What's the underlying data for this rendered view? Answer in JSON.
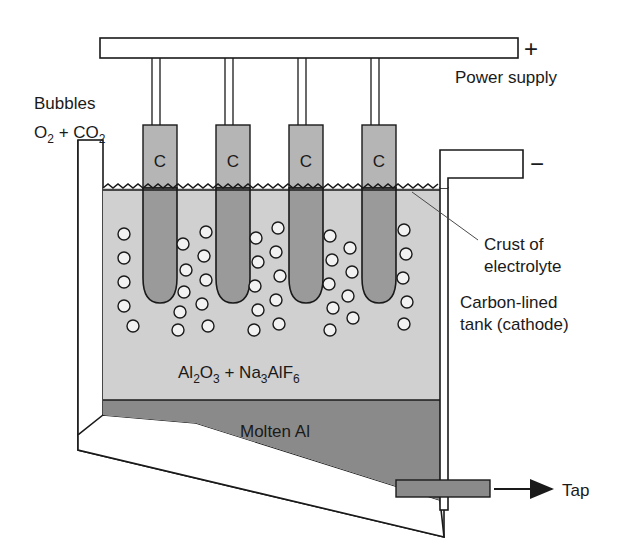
{
  "figure": {
    "background_color": "#ffffff",
    "ink_color": "#1a1a1a"
  },
  "colors": {
    "electrolyte_fill": "#d0d0d0",
    "molten_metal_fill": "#8a8a8a",
    "anode_above_fill": "#b5b5b5",
    "anode_below_fill": "#9a9a9a",
    "bubble_fill": "#f2f2f2",
    "wall_fill": "#ffffff",
    "busbar_fill": "#ffffff",
    "outline": "#1a1a1a"
  },
  "labels": {
    "power_supply": "Power supply",
    "plus_terminal": "+",
    "minus_terminal": "−",
    "bubbles_line1": "Bubbles",
    "bubbles_formula_main1": "O",
    "bubbles_formula_sub1": "2",
    "bubbles_formula_plus": " + ",
    "bubbles_formula_main2": "CO",
    "bubbles_formula_sub2": "2",
    "crust_line1": "Crust of",
    "crust_line2": "electrolyte",
    "tank_line1": "Carbon-lined",
    "tank_line2": "tank (cathode)",
    "electrolyte_formula": "Al2O3 + Na3AlF6",
    "molten_metal": "Molten Al",
    "tap": "Tap",
    "anode_letter": "C"
  },
  "electrolyte_formula_parts": [
    {
      "text": "Al",
      "sub": false
    },
    {
      "text": "2",
      "sub": true
    },
    {
      "text": "O",
      "sub": false
    },
    {
      "text": "3",
      "sub": true
    },
    {
      "text": " + ",
      "sub": false
    },
    {
      "text": "Na",
      "sub": false
    },
    {
      "text": "3",
      "sub": true
    },
    {
      "text": "AlF",
      "sub": false
    },
    {
      "text": "6",
      "sub": true
    }
  ],
  "anodes": [
    {
      "id": "anode-1",
      "letter": "C",
      "x": 143,
      "width": 34,
      "top": 125,
      "bottom": 303
    },
    {
      "id": "anode-2",
      "letter": "C",
      "x": 216,
      "width": 34,
      "top": 125,
      "bottom": 303
    },
    {
      "id": "anode-3",
      "letter": "C",
      "x": 289,
      "width": 34,
      "top": 125,
      "bottom": 303
    },
    {
      "id": "anode-4",
      "letter": "C",
      "x": 362,
      "width": 34,
      "top": 125,
      "bottom": 303
    }
  ],
  "levels": {
    "busbar_top": 38,
    "busbar_bottom": 58,
    "crust_line": 188,
    "metal_top": 400,
    "cell_left": 95,
    "cell_right": 448
  },
  "bubbles": [
    {
      "cx": 124,
      "cy": 234
    },
    {
      "cx": 124,
      "cy": 258
    },
    {
      "cx": 124,
      "cy": 282
    },
    {
      "cx": 124,
      "cy": 306
    },
    {
      "cx": 133,
      "cy": 326
    },
    {
      "cx": 183,
      "cy": 244
    },
    {
      "cx": 186,
      "cy": 270
    },
    {
      "cx": 184,
      "cy": 292
    },
    {
      "cx": 180,
      "cy": 312
    },
    {
      "cx": 178,
      "cy": 330
    },
    {
      "cx": 206,
      "cy": 232
    },
    {
      "cx": 204,
      "cy": 256
    },
    {
      "cx": 206,
      "cy": 280
    },
    {
      "cx": 202,
      "cy": 304
    },
    {
      "cx": 208,
      "cy": 326
    },
    {
      "cx": 256,
      "cy": 238
    },
    {
      "cx": 258,
      "cy": 262
    },
    {
      "cx": 255,
      "cy": 286
    },
    {
      "cx": 258,
      "cy": 310
    },
    {
      "cx": 254,
      "cy": 330
    },
    {
      "cx": 278,
      "cy": 228
    },
    {
      "cx": 276,
      "cy": 252
    },
    {
      "cx": 280,
      "cy": 276
    },
    {
      "cx": 276,
      "cy": 300
    },
    {
      "cx": 279,
      "cy": 324
    },
    {
      "cx": 330,
      "cy": 236
    },
    {
      "cx": 332,
      "cy": 260
    },
    {
      "cx": 329,
      "cy": 284
    },
    {
      "cx": 333,
      "cy": 308
    },
    {
      "cx": 330,
      "cy": 330
    },
    {
      "cx": 350,
      "cy": 248
    },
    {
      "cx": 352,
      "cy": 272
    },
    {
      "cx": 348,
      "cy": 296
    },
    {
      "cx": 353,
      "cy": 318
    },
    {
      "cx": 404,
      "cy": 230
    },
    {
      "cx": 406,
      "cy": 254
    },
    {
      "cx": 403,
      "cy": 278
    },
    {
      "cx": 407,
      "cy": 302
    },
    {
      "cx": 404,
      "cy": 324
    }
  ],
  "bubble_radius": 6
}
